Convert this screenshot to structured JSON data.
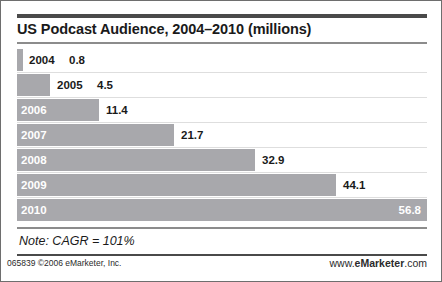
{
  "title": "US Podcast Audience, 2004–2010 (millions)",
  "note": "Note: CAGR = 101%",
  "footer": {
    "left": "065839 ©2006 eMarketer, Inc.",
    "right_prefix": "www.",
    "right_brand": "eMarketer",
    "right_suffix": ".com"
  },
  "colors": {
    "bar": "#a8a8ac",
    "rule_dark": "#4a4a4a",
    "rule_light": "#8c8c8c",
    "text": "#1a1a1a",
    "text_on_bar": "#ffffff",
    "border": "#6e6e6e",
    "background": "#ffffff"
  },
  "chart_data": {
    "type": "bar",
    "orientation": "horizontal",
    "title": "US Podcast Audience, 2004–2010 (millions)",
    "xlabel": "",
    "ylabel": "",
    "unit": "millions",
    "categories": [
      "2004",
      "2005",
      "2006",
      "2007",
      "2008",
      "2009",
      "2010"
    ],
    "values": [
      0.8,
      4.5,
      11.4,
      21.7,
      32.9,
      44.1,
      56.8
    ],
    "value_labels": [
      "0.8",
      "4.5",
      "11.4",
      "21.7",
      "32.9",
      "44.1",
      "56.8"
    ],
    "xlim": [
      0,
      56.8
    ],
    "grid": false,
    "legend": false,
    "annotations": [
      "Note: CAGR = 101%"
    ]
  },
  "rows": [
    {
      "year": "2004",
      "value": "0.8",
      "width_px": 6,
      "label_inside": false,
      "value_inside": false,
      "year_left_px": 12,
      "value_left_px": 52
    },
    {
      "year": "2005",
      "value": "4.5",
      "width_px": 33,
      "label_inside": false,
      "value_inside": false,
      "year_left_px": 40,
      "value_left_px": 80
    },
    {
      "year": "2006",
      "value": "11.4",
      "width_px": 82,
      "label_inside": true,
      "value_inside": false,
      "value_left_px": 89
    },
    {
      "year": "2007",
      "value": "21.7",
      "width_px": 157,
      "label_inside": true,
      "value_inside": false,
      "value_left_px": 164
    },
    {
      "year": "2008",
      "value": "32.9",
      "width_px": 238,
      "label_inside": true,
      "value_inside": false,
      "value_left_px": 245
    },
    {
      "year": "2009",
      "value": "44.1",
      "width_px": 319,
      "label_inside": true,
      "value_inside": false,
      "value_left_px": 326
    },
    {
      "year": "2010",
      "value": "56.8",
      "width_px": 410,
      "label_inside": true,
      "value_inside": true,
      "value_right_px": 6
    }
  ]
}
